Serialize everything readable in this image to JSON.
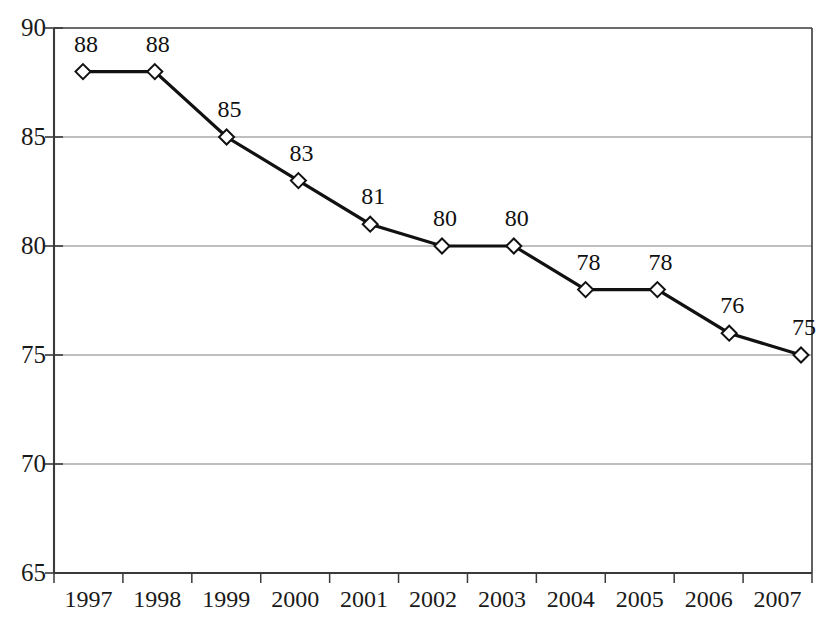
{
  "chart_data": {
    "type": "line",
    "title": "",
    "subtitle": "",
    "xlabel": "",
    "ylabel": "",
    "categories": [
      "1997",
      "1998",
      "1999",
      "2000",
      "2001",
      "2002",
      "2003",
      "2004",
      "2005",
      "2006",
      "2007"
    ],
    "values": [
      88,
      88,
      85,
      83,
      81,
      80,
      80,
      78,
      78,
      76,
      75
    ],
    "point_labels": [
      "88",
      "88",
      "85",
      "83",
      "81",
      "80",
      "80",
      "78",
      "78",
      "76",
      "75"
    ],
    "series": [
      {
        "name": "",
        "values": [
          88,
          88,
          85,
          83,
          81,
          80,
          80,
          78,
          78,
          76,
          75
        ]
      }
    ],
    "ylim": [
      65,
      90
    ],
    "yticks": [
      65,
      70,
      75,
      80,
      85,
      90
    ],
    "ytick_labels": [
      "65",
      "70",
      "75",
      "80",
      "85",
      "90"
    ],
    "grid": true,
    "grid_axis": "y",
    "legend": false,
    "legend_position": "none",
    "marker": "diamond-open",
    "line_color": "#111111",
    "marker_fill": "#ffffff",
    "marker_edge": "#111111",
    "grid_color": "#808080",
    "axis_color": "#3a3a3a",
    "background": "#ffffff",
    "annotations": []
  },
  "geometry": {
    "plot_left": 54,
    "plot_right": 812,
    "plot_top": 28,
    "plot_bottom": 573,
    "first_point_x": 83,
    "point_spacing": 71.8
  }
}
